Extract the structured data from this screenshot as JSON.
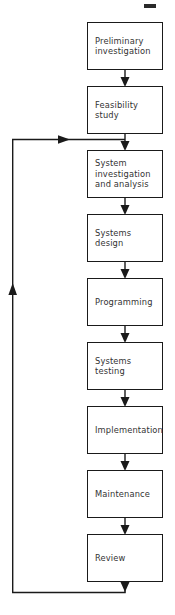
{
  "diagram": {
    "type": "flowchart",
    "orientation": "top-to-bottom",
    "stroke_color": "#1a1a1a",
    "text_color": "#333333",
    "background_color": "#ffffff",
    "nodes": [
      {
        "id": "preliminary-investigation",
        "label": "Preliminary\ninvestigation",
        "x": 87,
        "y": 22,
        "w": 76,
        "h": 48
      },
      {
        "id": "feasibility-study",
        "label": "Feasibility\nstudy",
        "x": 87,
        "y": 86,
        "w": 76,
        "h": 48
      },
      {
        "id": "system-investigation-and-analysis",
        "label": "System\ninvestigation\nand analysis",
        "x": 87,
        "y": 150,
        "w": 76,
        "h": 48
      },
      {
        "id": "systems-design",
        "label": "Systems\ndesign",
        "x": 87,
        "y": 214,
        "w": 76,
        "h": 48
      },
      {
        "id": "programming",
        "label": "Programming",
        "x": 87,
        "y": 278,
        "w": 76,
        "h": 48
      },
      {
        "id": "systems-testing",
        "label": "Systems\ntesting",
        "x": 87,
        "y": 342,
        "w": 76,
        "h": 48
      },
      {
        "id": "implementation",
        "label": "Implementation",
        "x": 87,
        "y": 406,
        "w": 76,
        "h": 48
      },
      {
        "id": "maintenance",
        "label": "Maintenance",
        "x": 87,
        "y": 470,
        "w": 76,
        "h": 48
      },
      {
        "id": "review",
        "label": "Review",
        "x": 87,
        "y": 534,
        "w": 76,
        "h": 48
      }
    ],
    "connectors": [
      {
        "id": "arrow-preliminary-to-feasibility",
        "from": "preliminary-investigation",
        "to": "feasibility-study"
      },
      {
        "id": "arrow-feasibility-to-system-investigation",
        "from": "feasibility-study",
        "to": "system-investigation-and-analysis"
      },
      {
        "id": "arrow-system-investigation-to-systems-design",
        "from": "system-investigation-and-analysis",
        "to": "systems-design"
      },
      {
        "id": "arrow-systems-design-to-programming",
        "from": "systems-design",
        "to": "programming"
      },
      {
        "id": "arrow-programming-to-systems-testing",
        "from": "programming",
        "to": "systems-testing"
      },
      {
        "id": "arrow-systems-testing-to-implementation",
        "from": "systems-testing",
        "to": "implementation"
      },
      {
        "id": "arrow-implementation-to-maintenance",
        "from": "implementation",
        "to": "maintenance"
      },
      {
        "id": "arrow-maintenance-to-review",
        "from": "maintenance",
        "to": "review"
      },
      {
        "id": "feedback-loop-review-to-system-investigation",
        "from": "review",
        "to": "system-investigation-and-analysis",
        "style": "loop-left"
      }
    ]
  }
}
